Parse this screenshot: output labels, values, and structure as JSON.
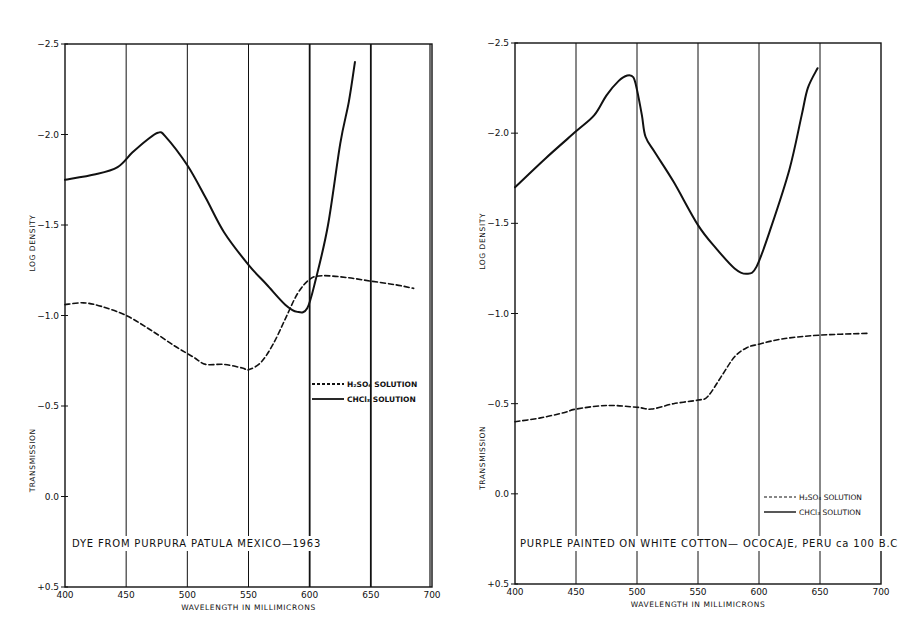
{
  "chart_data": [
    {
      "type": "line",
      "title": "DYE FROM PURPURA PATULA MEXICO—1963",
      "xlabel": "WAVELENGTH IN MILLIMICRONS",
      "ylabel_upper": "LOG DENSITY",
      "ylabel_lower": "TRANSMISSION",
      "xlim": [
        400,
        700
      ],
      "ylim": [
        0.5,
        -2.5
      ],
      "x_ticks": [
        "400",
        "450",
        "500",
        "550",
        "600",
        "650",
        "700"
      ],
      "y_ticks": [
        "-2.5",
        "-2.0",
        "-1.5",
        "-1.0",
        "-0.5",
        "0.0",
        "+0.5"
      ],
      "grid": "vertical lines every 50",
      "legend": [
        "H2SO4 SOLUTION",
        "CHCl3 SOLUTION"
      ],
      "series": [
        {
          "name": "CHCl3 SOLUTION",
          "style": "solid",
          "x": [
            400,
            425,
            443,
            455,
            467,
            476,
            482,
            500,
            515,
            530,
            550,
            565,
            580,
            590,
            598,
            605,
            615,
            625,
            632,
            637
          ],
          "y": [
            -1.75,
            -1.78,
            -1.82,
            -1.9,
            -1.97,
            -2.01,
            -1.99,
            -1.83,
            -1.65,
            -1.46,
            -1.28,
            -1.17,
            -1.06,
            -1.02,
            -1.04,
            -1.2,
            -1.5,
            -1.95,
            -2.18,
            -2.4
          ]
        },
        {
          "name": "H2SO4 SOLUTION",
          "style": "dashed",
          "x": [
            400,
            415,
            430,
            450,
            470,
            490,
            505,
            515,
            530,
            545,
            550,
            560,
            570,
            580,
            590,
            600,
            610,
            630,
            650,
            670,
            685
          ],
          "y": [
            -1.06,
            -1.07,
            -1.05,
            -1.0,
            -0.92,
            -0.83,
            -0.77,
            -0.73,
            -0.73,
            -0.71,
            -0.7,
            -0.74,
            -0.84,
            -0.98,
            -1.12,
            -1.2,
            -1.22,
            -1.21,
            -1.19,
            -1.17,
            -1.15
          ]
        }
      ]
    },
    {
      "type": "line",
      "title": "PURPLE PAINTED ON WHITE COTTON— OCOCAJE, PERU ca 100 B.C",
      "xlabel": "WAVELENGTH IN MILLIMICRONS",
      "ylabel_upper": "LOG DENSITY",
      "ylabel_lower": "TRANSMISSION",
      "xlim": [
        400,
        700
      ],
      "ylim": [
        0.5,
        -2.5
      ],
      "x_ticks": [
        "400",
        "450",
        "500",
        "550",
        "600",
        "650",
        "700"
      ],
      "y_ticks": [
        "-2.5",
        "-2.0",
        "-1.5",
        "-1.0",
        "-0.5",
        "0.0",
        "+0.5"
      ],
      "grid": "vertical lines every 50",
      "legend": [
        "H2SO4 SOLUTION",
        "CHCl3 SOLUTION"
      ],
      "series": [
        {
          "name": "CHCl3 SOLUTION",
          "style": "solid",
          "x": [
            400,
            425,
            450,
            465,
            475,
            485,
            492,
            497,
            500,
            504,
            507,
            515,
            530,
            550,
            565,
            580,
            590,
            598,
            610,
            625,
            635,
            640,
            648
          ],
          "y": [
            -1.7,
            -1.86,
            -2.01,
            -2.1,
            -2.21,
            -2.29,
            -2.32,
            -2.31,
            -2.24,
            -2.1,
            -1.98,
            -1.89,
            -1.73,
            -1.49,
            -1.36,
            -1.25,
            -1.22,
            -1.26,
            -1.48,
            -1.8,
            -2.1,
            -2.25,
            -2.36
          ]
        },
        {
          "name": "H2SO4 SOLUTION",
          "style": "dashed",
          "x": [
            400,
            420,
            440,
            450,
            475,
            500,
            512,
            530,
            550,
            558,
            570,
            580,
            590,
            600,
            620,
            650,
            690
          ],
          "y": [
            -0.4,
            -0.42,
            -0.45,
            -0.47,
            -0.49,
            -0.48,
            -0.47,
            -0.5,
            -0.52,
            -0.54,
            -0.66,
            -0.76,
            -0.81,
            -0.83,
            -0.86,
            -0.88,
            -0.89
          ]
        }
      ]
    }
  ],
  "left_chart": {
    "caption": "DYE FROM PURPURA PATULA  MEXICO—1963",
    "xlabel": "WAVELENGTH IN MILLIMICRONS",
    "ylabel_upper": "LOG DENSITY",
    "ylabel_lower": "TRANSMISSION",
    "legend_h2so4": "H₂SO₄ SOLUTION",
    "legend_chcl3": "CHCl₃ SOLUTION"
  },
  "right_chart": {
    "caption": "PURPLE PAINTED ON WHITE COTTON— OCOCAJE, PERU ca 100 B.C",
    "xlabel": "WAVELENGTH IN MILLIMICRONS",
    "ylabel_upper": "LOG DENSITY",
    "ylabel_lower": "TRANSMISSION",
    "legend_h2so4": "H₂SO₄ SOLUTION",
    "legend_chcl3": "CHCl₃ SOLUTION"
  },
  "colors": {
    "ink": "#111111",
    "paper": "#ffffff"
  }
}
